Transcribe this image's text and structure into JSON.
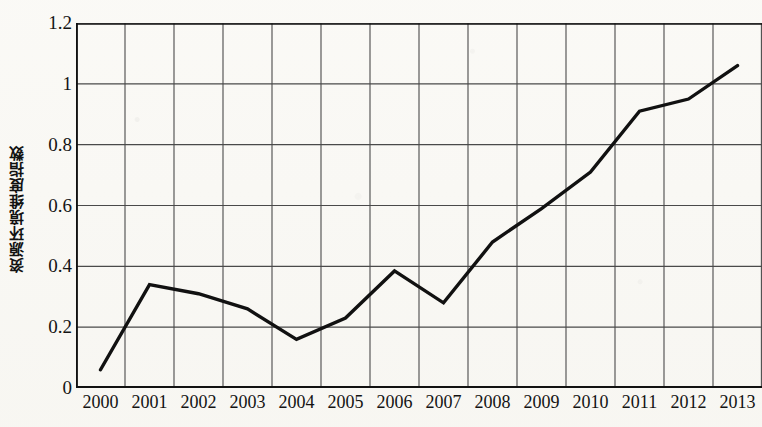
{
  "chart_data": {
    "type": "line",
    "title": "",
    "xlabel": "",
    "ylabel": "资源环境维度指数",
    "categories": [
      "2000",
      "2001",
      "2002",
      "2003",
      "2004",
      "2005",
      "2006",
      "2007",
      "2008",
      "2009",
      "2010",
      "2011",
      "2012",
      "2013"
    ],
    "values": [
      0.06,
      0.34,
      0.31,
      0.26,
      0.16,
      0.23,
      0.385,
      0.28,
      0.48,
      0.59,
      0.71,
      0.91,
      0.95,
      1.06
    ],
    "series": [
      {
        "name": "资源环境维度指数",
        "values": [
          0.06,
          0.34,
          0.31,
          0.26,
          0.16,
          0.23,
          0.385,
          0.28,
          0.48,
          0.59,
          0.71,
          0.91,
          0.95,
          1.06
        ]
      }
    ],
    "ylim": [
      0,
      1.2
    ],
    "ytick_labels": [
      "0",
      "0.2",
      "0.4",
      "0.6",
      "0.8",
      "1",
      "1.2"
    ],
    "ytick_values": [
      0,
      0.2,
      0.4,
      0.6,
      0.8,
      1,
      1.2
    ],
    "xtick_labels": [
      "2000",
      "2001",
      "2002",
      "2003",
      "2004",
      "2005",
      "2006",
      "2007",
      "2008",
      "2009",
      "2010",
      "2011",
      "2012",
      "2013"
    ],
    "grid": true,
    "grid_x": true,
    "grid_y": true,
    "legend": false,
    "legend_position": "none",
    "line_color": "#111111",
    "grid_color": "#4a4a4a",
    "axis_color": "#111111",
    "background_color": "#fbfaf7",
    "markers": false
  }
}
